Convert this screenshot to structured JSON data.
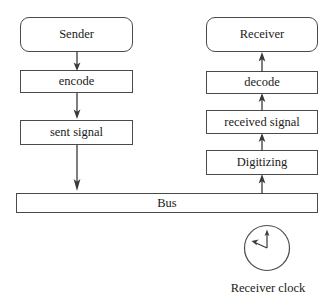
{
  "diagram": {
    "stroke_color": "#4a4a4a",
    "text_color": "#1a1a1a",
    "background": "#ffffff",
    "left_column": [
      {
        "label": "Sender",
        "shape": "rounded-rect"
      },
      {
        "label": "encode",
        "shape": "rect"
      },
      {
        "label": "sent signal",
        "shape": "rect"
      }
    ],
    "right_column": [
      {
        "label": "Receiver",
        "shape": "rounded-rect"
      },
      {
        "label": "decode",
        "shape": "rect"
      },
      {
        "label": "received signal",
        "shape": "rect"
      },
      {
        "label": "Digitizing",
        "shape": "rect"
      }
    ],
    "bus": {
      "label": "Bus"
    },
    "clock": {
      "caption": "Receiver clock",
      "minute_hand_direction": "up",
      "hour_hand_direction": "upper-left"
    },
    "arrows": [
      {
        "from": "Sender",
        "to": "encode",
        "direction": "down"
      },
      {
        "from": "encode",
        "to": "sent signal",
        "direction": "down"
      },
      {
        "from": "sent signal",
        "to": "Bus",
        "direction": "down"
      },
      {
        "from": "Bus",
        "to": "Digitizing",
        "direction": "up"
      },
      {
        "from": "Digitizing",
        "to": "received signal",
        "direction": "up"
      },
      {
        "from": "received signal",
        "to": "decode",
        "direction": "up"
      },
      {
        "from": "decode",
        "to": "Receiver",
        "direction": "up"
      }
    ]
  }
}
